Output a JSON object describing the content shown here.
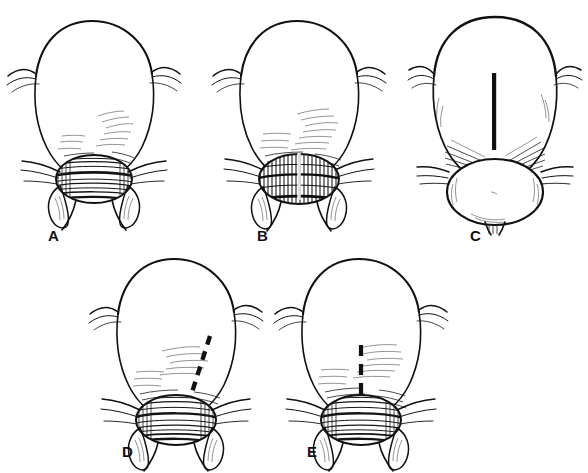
{
  "figure": {
    "kind": "anatomical-line-drawing",
    "style": "pen-and-ink black-and-white medical illustration",
    "background_color": "#ffffff",
    "ink_color": "#111111",
    "width": 588,
    "height": 473,
    "bottom_artifact_text": "",
    "panels": [
      {
        "id": "A",
        "label": "A",
        "label_x": 48,
        "label_y": 228,
        "subject": "bladder-with-prostate-intact",
        "marking": "none",
        "description": "Bladder viewed from front with intact prostate encircled by hatched fibers; urethra below; lateral pelvic attachments flanking both sides."
      },
      {
        "id": "B",
        "label": "B",
        "label_x": 257,
        "label_y": 228,
        "subject": "bladder-with-prostate-vertical-incision",
        "marking": "solid-white-vertical-incision",
        "marking_color": "#ffffff",
        "description": "Same view as A with a vertical midline incision opened through the hatched prostatic capsule."
      },
      {
        "id": "C",
        "label": "C",
        "label_x": 470,
        "label_y": 228,
        "subject": "bladder-over-rounded-lower-structure",
        "marking": "solid-black-vertical-line",
        "marking_color": "#111111",
        "description": "Elongated bladder above a rounded smooth lower structure; a thick solid black vertical bar marks the planned midline incision."
      },
      {
        "id": "D",
        "label": "D",
        "label_x": 122,
        "label_y": 447,
        "subject": "bladder-with-prostate-oblique-dashed-line",
        "marking": "dashed-black-oblique-line",
        "marking_color": "#111111",
        "description": "Bladder and hatched prostate with an oblique dashed black line on the right descending toward the prostatic junction."
      },
      {
        "id": "E",
        "label": "E",
        "label_x": 307,
        "label_y": 447,
        "subject": "bladder-with-prostate-vertical-dashed-line",
        "marking": "dashed-black-vertical-line",
        "marking_color": "#111111",
        "description": "Bladder and hatched prostate with a short vertical dashed black line in the midline entering the prostate."
      }
    ]
  }
}
